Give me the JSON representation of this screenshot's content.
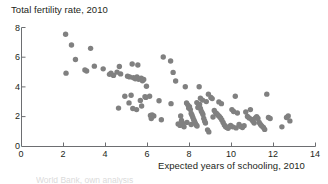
{
  "chart_data": {
    "type": "scatter",
    "title": "Total fertility rate, 2010",
    "ylabel": "Total fertility rate, 2010",
    "xlabel": "Expected years of schooling, 2010",
    "xlim": [
      0,
      14
    ],
    "ylim": [
      0,
      8
    ],
    "grid": false,
    "legend": null,
    "xticks": [
      "0",
      "2",
      "4",
      "6",
      "8",
      "10",
      "12",
      "14"
    ],
    "yticks": [
      "0",
      "2",
      "4",
      "6",
      "8"
    ],
    "marker": {
      "shape": "circle",
      "color": "#808080",
      "size_px": 5.4
    },
    "series": [
      {
        "name": "Countries",
        "points": [
          [
            2.1,
            7.55
          ],
          [
            2.38,
            6.82
          ],
          [
            3.29,
            6.6
          ],
          [
            2.57,
            5.85
          ],
          [
            2.12,
            4.93
          ],
          [
            3.02,
            5.15
          ],
          [
            3.1,
            5.08
          ],
          [
            3.47,
            5.4
          ],
          [
            3.89,
            5.22
          ],
          [
            4.19,
            4.85
          ],
          [
            4.26,
            4.93
          ],
          [
            4.38,
            4.78
          ],
          [
            4.55,
            5.0
          ],
          [
            4.66,
            5.38
          ],
          [
            4.72,
            4.88
          ],
          [
            4.62,
            2.58
          ],
          [
            5.05,
            4.72
          ],
          [
            5.15,
            4.68
          ],
          [
            5.22,
            3.45
          ],
          [
            5.27,
            5.55
          ],
          [
            5.33,
            4.63
          ],
          [
            5.42,
            4.55
          ],
          [
            5.5,
            4.68
          ],
          [
            5.54,
            5.48
          ],
          [
            5.58,
            4.52
          ],
          [
            5.12,
            2.93
          ],
          [
            5.3,
            2.55
          ],
          [
            5.48,
            2.48
          ],
          [
            5.7,
            4.6
          ],
          [
            5.76,
            4.42
          ],
          [
            5.82,
            4.5
          ],
          [
            5.88,
            3.35
          ],
          [
            5.92,
            3.3
          ],
          [
            5.95,
            4.05
          ],
          [
            5.66,
            3.1
          ],
          [
            5.72,
            2.72
          ],
          [
            6.1,
            3.38
          ],
          [
            6.14,
            2.08
          ],
          [
            6.18,
            1.88
          ],
          [
            6.22,
            2.12
          ],
          [
            6.55,
            3.08
          ],
          [
            6.66,
            1.8
          ],
          [
            6.75,
            6.02
          ],
          [
            7.1,
            5.75
          ],
          [
            7.22,
            4.98
          ],
          [
            7.34,
            4.4
          ],
          [
            7.12,
            2.88
          ],
          [
            7.46,
            1.52
          ],
          [
            7.55,
            1.42
          ],
          [
            7.62,
            1.75
          ],
          [
            7.68,
            1.55
          ],
          [
            7.74,
            1.32
          ],
          [
            7.8,
            4.02
          ],
          [
            7.86,
            2.92
          ],
          [
            7.92,
            2.8
          ],
          [
            7.96,
            2.58
          ],
          [
            8.0,
            2.68
          ],
          [
            8.04,
            2.48
          ],
          [
            8.08,
            2.22
          ],
          [
            8.12,
            2.1
          ],
          [
            8.16,
            1.95
          ],
          [
            8.2,
            1.8
          ],
          [
            8.24,
            1.68
          ],
          [
            8.28,
            1.55
          ],
          [
            8.32,
            1.45
          ],
          [
            8.36,
            1.38
          ],
          [
            8.4,
            2.62
          ],
          [
            8.44,
            2.72
          ],
          [
            8.48,
            2.82
          ],
          [
            8.52,
            2.55
          ],
          [
            8.56,
            2.38
          ],
          [
            8.6,
            2.28
          ],
          [
            8.64,
            2.15
          ],
          [
            8.68,
            1.88
          ],
          [
            8.72,
            1.72
          ],
          [
            8.76,
            1.58
          ],
          [
            8.8,
            3.02
          ],
          [
            8.52,
            3.25
          ],
          [
            8.62,
            3.12
          ],
          [
            8.86,
            1.12
          ],
          [
            8.92,
            0.98
          ],
          [
            8.46,
            4.02
          ],
          [
            8.9,
            3.52
          ],
          [
            9.02,
            3.3
          ],
          [
            9.08,
            3.22
          ],
          [
            9.18,
            2.42
          ],
          [
            9.24,
            2.28
          ],
          [
            9.3,
            2.2
          ],
          [
            9.36,
            2.1
          ],
          [
            9.42,
            2.02
          ],
          [
            9.48,
            1.92
          ],
          [
            9.54,
            1.78
          ],
          [
            9.6,
            1.62
          ],
          [
            9.66,
            1.45
          ],
          [
            9.72,
            1.32
          ],
          [
            9.78,
            1.28
          ],
          [
            9.84,
            1.22
          ],
          [
            9.9,
            1.35
          ],
          [
            9.96,
            1.42
          ],
          [
            9.4,
            3.0
          ],
          [
            9.52,
            2.88
          ],
          [
            10.02,
            2.48
          ],
          [
            10.1,
            2.35
          ],
          [
            10.18,
            3.38
          ],
          [
            10.28,
            2.25
          ],
          [
            10.36,
            1.48
          ],
          [
            10.44,
            1.35
          ],
          [
            10.52,
            1.28
          ],
          [
            10.6,
            1.4
          ],
          [
            10.68,
            2.32
          ],
          [
            10.76,
            2.02
          ],
          [
            10.84,
            1.92
          ],
          [
            10.9,
            2.48
          ],
          [
            10.96,
            1.82
          ],
          [
            11.02,
            1.7
          ],
          [
            11.08,
            1.58
          ],
          [
            11.14,
            1.92
          ],
          [
            11.2,
            2.0
          ],
          [
            11.26,
            1.88
          ],
          [
            11.32,
            1.62
          ],
          [
            11.38,
            1.48
          ],
          [
            11.44,
            1.38
          ],
          [
            11.52,
            1.28
          ],
          [
            11.58,
            1.15
          ],
          [
            11.68,
            3.52
          ],
          [
            11.76,
            1.95
          ],
          [
            11.84,
            1.88
          ],
          [
            12.4,
            1.32
          ],
          [
            12.62,
            1.95
          ],
          [
            12.7,
            2.05
          ],
          [
            12.78,
            1.72
          ],
          [
            10.22,
            1.25
          ],
          [
            10.06,
            1.32
          ],
          [
            7.58,
            2.05
          ],
          [
            7.88,
            1.62
          ],
          [
            8.08,
            1.48
          ],
          [
            8.35,
            2.95
          ],
          [
            9.12,
            1.98
          ],
          [
            6.3,
            2.05
          ],
          [
            4.92,
            3.38
          ]
        ]
      }
    ]
  },
  "footer": {
    "cut_text": "World Bank, own analysis"
  }
}
